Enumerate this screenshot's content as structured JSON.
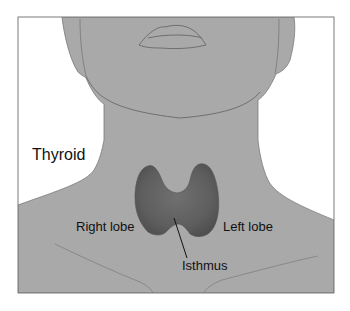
{
  "diagram": {
    "title": "Thyroid",
    "labels": {
      "right_lobe": "Right lobe",
      "left_lobe": "Left lobe",
      "isthmus": "Isthmus"
    },
    "colors": {
      "skin": "#a9a9a9",
      "outline": "#6f6f6f",
      "frame": "#7a7a7a",
      "thyroid": "#5e5e5e",
      "background": "#ffffff"
    }
  }
}
